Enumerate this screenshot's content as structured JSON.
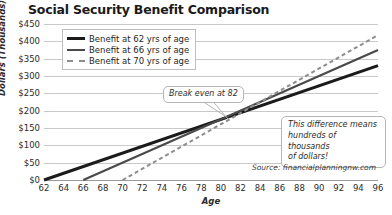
{
  "chart_data": {
    "type": "line",
    "title": "Social Security Benefit Comparison",
    "xlabel": "Age",
    "ylabel": "Dollars (Thousands)",
    "xlim": [
      62,
      96
    ],
    "ylim": [
      0,
      450
    ],
    "grid": true,
    "xticks": [
      62,
      64,
      66,
      68,
      70,
      72,
      74,
      76,
      78,
      80,
      82,
      84,
      86,
      88,
      90,
      92,
      94,
      96
    ],
    "xtick_labels": [
      "62",
      "64",
      "66",
      "68",
      "70",
      "72",
      "74",
      "76",
      "78",
      "80",
      "82",
      "84",
      "86",
      "88",
      "90",
      "92",
      "94",
      "96"
    ],
    "yticks": [
      0,
      50,
      100,
      150,
      200,
      250,
      300,
      350,
      400,
      450
    ],
    "ytick_labels": [
      "$0",
      "$50",
      "$100",
      "$150",
      "$200",
      "$250",
      "$300",
      "$350",
      "$400",
      "$450"
    ],
    "legend_position": "upper-left-inside",
    "series": [
      {
        "name": "Benefit at 62 yrs of age",
        "color": "#1b1b1b",
        "style": "solid",
        "width": 3,
        "start_age": 62,
        "end_age": 96,
        "start_value": 0,
        "end_value": 330,
        "points": [
          [
            62,
            0
          ],
          [
            96,
            330
          ]
        ]
      },
      {
        "name": "Benefit at 66 yrs of age",
        "color": "#4a4a4a",
        "style": "solid",
        "width": 2.2,
        "start_age": 66,
        "end_age": 96,
        "start_value": 0,
        "end_value": 375,
        "points": [
          [
            66,
            0
          ],
          [
            96,
            375
          ]
        ]
      },
      {
        "name": "Benefit at 70 yrs of age",
        "color": "#8d8d8d",
        "style": "dashed",
        "width": 2,
        "start_age": 70,
        "end_age": 96,
        "start_value": 0,
        "end_value": 418,
        "points": [
          [
            70,
            0
          ],
          [
            96,
            418
          ]
        ]
      }
    ],
    "annotations": [
      {
        "name": "break-even",
        "text": "Break even at 82",
        "age": 82,
        "value": 195
      },
      {
        "name": "difference",
        "text": "This difference means hundreds of thousands of dollars!",
        "age": 92,
        "value": 120
      }
    ],
    "source": "Source: financialplanningnw.com"
  },
  "callouts": {
    "breakeven": "Break even at 82",
    "difference_line1": "This difference means",
    "difference_line2": "hundreds of thousands",
    "difference_line3": "of dollars!"
  }
}
